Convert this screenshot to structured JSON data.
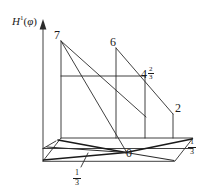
{
  "figure": {
    "title": "",
    "axis": {
      "vertical_label_base": "H",
      "vertical_label_sup": "1",
      "vertical_label_arg_open": "(",
      "vertical_label_arg": "φ",
      "vertical_label_arg_close": ")",
      "vertical_label_full": "H¹(φ)",
      "arrow_direction": "up"
    },
    "ink_color": "#1a1a1a",
    "background_color": "#ffffff",
    "labels": {
      "peak_left": "7",
      "peak_mid": "6",
      "step_right_whole": "4",
      "step_right_numer": "2",
      "step_right_denom": "3",
      "step_right_full": "4 2/3",
      "end_right": "2",
      "origin": "0",
      "base_front_numer": "1",
      "base_front_denom": "3",
      "base_front_full": "1/3",
      "base_right_numer": "1",
      "base_right_denom": "3",
      "base_right_full": "1/3"
    },
    "geometry": {
      "axis_line": {
        "x1": 43,
        "y1": 161,
        "x2": 43,
        "y2": 24
      },
      "axis_arrow": [
        [
          43,
          20
        ],
        [
          40,
          29
        ],
        [
          46,
          29
        ]
      ],
      "base_quad": [
        [
          43,
          161
        ],
        [
          61,
          138
        ],
        [
          193,
          138
        ],
        [
          175,
          161
        ]
      ],
      "verticals": [
        {
          "name": "v7",
          "x1": 61,
          "y1": 138,
          "x2": 61,
          "y2": 41
        },
        {
          "name": "v6",
          "x1": 116,
          "y1": 138,
          "x2": 116,
          "y2": 48
        },
        {
          "name": "v467",
          "x1": 145,
          "y1": 138,
          "x2": 145,
          "y2": 76
        },
        {
          "name": "v2",
          "x1": 173,
          "y1": 138,
          "x2": 173,
          "y2": 114
        }
      ],
      "step_top_rect": [
        [
          61,
          76
        ],
        [
          145,
          76
        ],
        [
          145,
          138
        ],
        [
          61,
          138
        ]
      ],
      "slope_from_7": [
        [
          61,
          41
        ],
        [
          146,
          117
        ]
      ],
      "slope_7_to_0": [
        [
          61,
          41
        ],
        [
          126,
          153
        ]
      ],
      "slope_from_6": [
        [
          116,
          48
        ],
        [
          173,
          114
        ]
      ],
      "base_diagonals": [
        {
          "x1": 43,
          "y1": 161,
          "x2": 126,
          "y2": 153
        },
        {
          "x1": 61,
          "y1": 138,
          "x2": 126,
          "y2": 153
        },
        {
          "x1": 46,
          "y1": 148,
          "x2": 126,
          "y2": 153
        },
        {
          "x1": 126,
          "y1": 153,
          "x2": 193,
          "y2": 138
        },
        {
          "x1": 126,
          "y1": 153,
          "x2": 175,
          "y2": 161
        }
      ],
      "base_midlines": [
        {
          "x1": 43,
          "y1": 148,
          "x2": 193,
          "y2": 148
        },
        {
          "x1": 46,
          "y1": 148,
          "x2": 61,
          "y2": 138
        }
      ],
      "tick_front": {
        "x1": 81,
        "y1": 156,
        "x2": 88,
        "y2": 168
      }
    }
  }
}
